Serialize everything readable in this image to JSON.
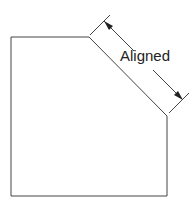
{
  "diagram": {
    "type": "aligned-dimension-example",
    "dimension_label": "Aligned",
    "colors": {
      "line": "#333333",
      "background": "#ffffff"
    }
  }
}
